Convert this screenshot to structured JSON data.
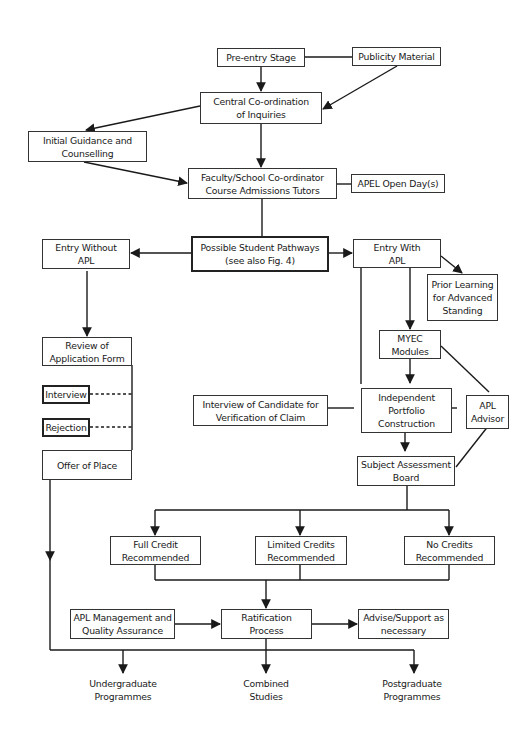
{
  "diagram": {
    "type": "flowchart",
    "nodes": {
      "pre_entry": {
        "line1": "Pre-entry Stage"
      },
      "publicity": {
        "line1": "Publicity Material"
      },
      "central": {
        "line1": "Central Co-ordination",
        "line2": "of Inquiries"
      },
      "initial_guidance": {
        "line1": "Initial Guidance and",
        "line2": "Counselling"
      },
      "faculty": {
        "line1": "Faculty/School Co-ordinator",
        "line2": "Course Admissions Tutors"
      },
      "apel_open_day": {
        "line1": "APEL Open Day(s)"
      },
      "pathways": {
        "line1": "Possible Student Pathways",
        "line2": "(see also Fig. 4)"
      },
      "entry_without": {
        "line1": "Entry Without",
        "line2": "APL"
      },
      "entry_with": {
        "line1": "Entry With",
        "line2": "APL"
      },
      "prior_learning": {
        "line1": "Prior Learning",
        "line2": "for Advanced",
        "line3": "Standing"
      },
      "myec": {
        "line1": "MYEC",
        "line2": "Modules"
      },
      "review": {
        "line1": "Review of",
        "line2": "Application Form"
      },
      "interview": {
        "line1": "Interview"
      },
      "rejection": {
        "line1": "Rejection"
      },
      "offer": {
        "line1": "Offer of Place"
      },
      "interview_candidate": {
        "line1": "Interview of Candidate for",
        "line2": "Verification of Claim"
      },
      "portfolio": {
        "line1": "Independent",
        "line2": "Portfolio",
        "line3": "Construction"
      },
      "apl_advisor": {
        "line1": "APL",
        "line2": "Advisor"
      },
      "subject_board": {
        "line1": "Subject Assessment",
        "line2": "Board"
      },
      "full_credit": {
        "line1": "Full Credit",
        "line2": "Recommended"
      },
      "limited_credits": {
        "line1": "Limited Credits",
        "line2": "Recommended"
      },
      "no_credits": {
        "line1": "No Credits",
        "line2": "Recommended"
      },
      "apl_management": {
        "line1": "APL Management and",
        "line2": "Quality Assurance"
      },
      "ratification": {
        "line1": "Ratification",
        "line2": "Process"
      },
      "advise_support": {
        "line1": "Advise/Support as",
        "line2": "necessary"
      }
    },
    "outcomes": {
      "undergraduate": {
        "line1": "Undergraduate",
        "line2": "Programmes"
      },
      "combined": {
        "line1": "Combined",
        "line2": "Studies"
      },
      "postgraduate": {
        "line1": "Postgraduate",
        "line2": "Programmes"
      }
    },
    "edges": [
      {
        "from": "Pre-entry Stage",
        "to": "Central Co-ordination of Inquiries",
        "style": "arrow"
      },
      {
        "from": "Pre-entry Stage",
        "to": "Publicity Material",
        "style": "line"
      },
      {
        "from": "Publicity Material",
        "to": "Central Co-ordination of Inquiries",
        "style": "arrow"
      },
      {
        "from": "Central Co-ordination of Inquiries",
        "to": "Initial Guidance and Counselling",
        "style": "arrow"
      },
      {
        "from": "Central Co-ordination of Inquiries",
        "to": "Faculty/School Co-ordinator",
        "style": "arrow"
      },
      {
        "from": "Initial Guidance and Counselling",
        "to": "Faculty/School Co-ordinator",
        "style": "arrow"
      },
      {
        "from": "Faculty/School Co-ordinator",
        "to": "APEL Open Day(s)",
        "style": "line"
      },
      {
        "from": "Faculty/School Co-ordinator",
        "to": "Possible Student Pathways",
        "style": "line"
      },
      {
        "from": "Possible Student Pathways",
        "to": "Entry Without APL",
        "style": "arrow"
      },
      {
        "from": "Possible Student Pathways",
        "to": "Entry With APL",
        "style": "arrow"
      },
      {
        "from": "Entry With APL",
        "to": "Prior Learning for Advanced Standing",
        "style": "arrow"
      },
      {
        "from": "Entry With APL",
        "to": "MYEC Modules",
        "style": "arrow"
      },
      {
        "from": "Entry With APL",
        "to": "Independent Portfolio Construction",
        "style": "line"
      },
      {
        "from": "MYEC Modules",
        "to": "Independent Portfolio Construction",
        "style": "arrow"
      },
      {
        "from": "MYEC Modules",
        "to": "APL Advisor",
        "style": "line"
      },
      {
        "from": "Interview of Candidate",
        "to": "Independent Portfolio Construction",
        "style": "line"
      },
      {
        "from": "Independent Portfolio Construction",
        "to": "APL Advisor",
        "style": "line"
      },
      {
        "from": "Independent Portfolio Construction",
        "to": "Subject Assessment Board",
        "style": "arrow"
      },
      {
        "from": "APL Advisor",
        "to": "Subject Assessment Board",
        "style": "line"
      },
      {
        "from": "Entry Without APL",
        "to": "Review of Application Form",
        "style": "arrow"
      },
      {
        "from": "Interview",
        "to": "Review of Application Form",
        "style": "dashed"
      },
      {
        "from": "Rejection",
        "to": "Review of Application Form",
        "style": "dashed"
      },
      {
        "from": "Subject Assessment Board",
        "to": "Full/Limited/No Credits",
        "style": "arrow"
      },
      {
        "from": "Credits",
        "to": "Ratification Process",
        "style": "arrow"
      },
      {
        "from": "APL Management and Quality Assurance",
        "to": "Ratification Process",
        "style": "arrow"
      },
      {
        "from": "Ratification Process",
        "to": "Advise/Support as necessary",
        "style": "arrow"
      },
      {
        "from": "Ratification Process / Offer of Place",
        "to": "Programmes",
        "style": "arrow"
      }
    ]
  }
}
